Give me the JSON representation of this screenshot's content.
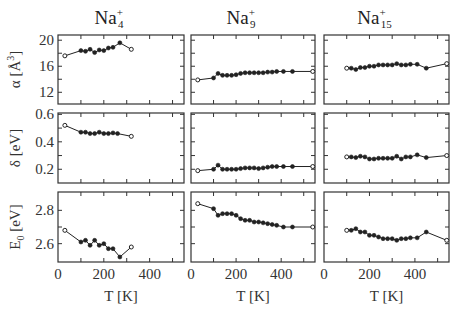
{
  "chart_data": {
    "type": "line",
    "layout": "3x3 grid of panels (rows: alpha, delta, E0; columns: Na4+, Na9+, Na15+)",
    "columns": [
      {
        "title_base": "Na",
        "title_sup": "+",
        "title_sub": "4"
      },
      {
        "title_base": "Na",
        "title_sup": "+",
        "title_sub": "9"
      },
      {
        "title_base": "Na",
        "title_sup": "+",
        "title_sub": "15"
      }
    ],
    "rows": [
      {
        "ylabel": "α [Å³]",
        "ylabel_parts": [
          "α [Å",
          "3",
          "]"
        ],
        "ylim": [
          10.2,
          20.8
        ],
        "yticks": [
          12,
          16,
          20
        ],
        "yminor": [
          14,
          18
        ]
      },
      {
        "ylabel": "δ [eV]",
        "ylim": [
          0.1,
          0.61
        ],
        "yticks": [
          0.2,
          0.4,
          0.6
        ],
        "yminor": [
          0.3,
          0.5
        ]
      },
      {
        "ylabel": "E₀ [eV]",
        "ylabel_parts": [
          "E",
          "0",
          " [eV]"
        ],
        "ylim": [
          2.49,
          2.91
        ],
        "yticks": [
          2.6,
          2.8
        ],
        "yminor": [
          2.7
        ]
      }
    ],
    "xlabel": "T [K]",
    "xlim": [
      0,
      550
    ],
    "xticks": [
      0,
      200,
      400
    ],
    "xminor": [
      100,
      300,
      500
    ],
    "grid": false,
    "legend": null,
    "series": {
      "alpha_Na4": {
        "x": [
          30,
          100,
          120,
          140,
          160,
          180,
          200,
          220,
          240,
          270,
          320
        ],
        "y": [
          17.6,
          18.4,
          18.3,
          18.6,
          18.1,
          18.5,
          18.4,
          18.8,
          18.9,
          19.6,
          18.6
        ]
      },
      "alpha_Na9": {
        "x": [
          30,
          100,
          120,
          140,
          160,
          180,
          200,
          220,
          240,
          260,
          280,
          300,
          320,
          340,
          360,
          380,
          410,
          450,
          540
        ],
        "y": [
          13.9,
          14.2,
          14.9,
          14.6,
          14.6,
          14.6,
          14.7,
          14.9,
          15.0,
          15.0,
          15.0,
          15.0,
          15.0,
          15.1,
          15.1,
          15.2,
          15.2,
          15.2,
          15.2
        ]
      },
      "alpha_Na15": {
        "x": [
          100,
          120,
          140,
          160,
          180,
          200,
          220,
          240,
          260,
          280,
          300,
          320,
          340,
          360,
          380,
          410,
          450,
          540
        ],
        "y": [
          15.7,
          15.7,
          15.5,
          15.8,
          15.8,
          16.0,
          16.0,
          16.2,
          16.2,
          16.2,
          16.2,
          16.4,
          16.2,
          16.2,
          16.3,
          16.3,
          15.7,
          16.4
        ]
      },
      "delta_Na4": {
        "x": [
          30,
          100,
          120,
          140,
          160,
          180,
          200,
          220,
          240,
          260,
          320
        ],
        "y": [
          0.52,
          0.47,
          0.47,
          0.46,
          0.46,
          0.47,
          0.46,
          0.46,
          0.465,
          0.46,
          0.44
        ]
      },
      "delta_Na9": {
        "x": [
          30,
          100,
          120,
          140,
          160,
          180,
          200,
          220,
          240,
          260,
          280,
          300,
          320,
          340,
          360,
          380,
          410,
          450,
          540
        ],
        "y": [
          0.19,
          0.2,
          0.23,
          0.2,
          0.2,
          0.2,
          0.2,
          0.205,
          0.21,
          0.21,
          0.21,
          0.205,
          0.21,
          0.215,
          0.22,
          0.22,
          0.22,
          0.22,
          0.22
        ]
      },
      "delta_Na15": {
        "x": [
          100,
          120,
          140,
          160,
          180,
          200,
          220,
          240,
          260,
          280,
          300,
          320,
          340,
          360,
          380,
          410,
          450,
          540
        ],
        "y": [
          0.29,
          0.29,
          0.285,
          0.295,
          0.29,
          0.275,
          0.275,
          0.28,
          0.28,
          0.28,
          0.28,
          0.295,
          0.275,
          0.29,
          0.29,
          0.305,
          0.285,
          0.3
        ]
      },
      "E0_Na4": {
        "x": [
          30,
          100,
          120,
          140,
          160,
          180,
          200,
          220,
          240,
          270,
          320
        ],
        "y": [
          2.68,
          2.61,
          2.62,
          2.59,
          2.62,
          2.59,
          2.6,
          2.57,
          2.57,
          2.52,
          2.58
        ]
      },
      "E0_Na9": {
        "x": [
          30,
          100,
          120,
          140,
          160,
          180,
          200,
          220,
          240,
          260,
          280,
          300,
          320,
          340,
          360,
          380,
          410,
          450,
          540
        ],
        "y": [
          2.84,
          2.81,
          2.77,
          2.78,
          2.78,
          2.78,
          2.77,
          2.75,
          2.74,
          2.74,
          2.73,
          2.73,
          2.725,
          2.72,
          2.715,
          2.71,
          2.7,
          2.7,
          2.7
        ]
      },
      "E0_Na15": {
        "x": [
          100,
          120,
          140,
          160,
          180,
          200,
          220,
          240,
          260,
          280,
          300,
          320,
          340,
          360,
          380,
          410,
          450,
          540
        ],
        "y": [
          2.68,
          2.68,
          2.69,
          2.67,
          2.67,
          2.65,
          2.65,
          2.64,
          2.63,
          2.63,
          2.63,
          2.62,
          2.63,
          2.63,
          2.635,
          2.635,
          2.67,
          2.62
        ]
      }
    },
    "open_markers": "first and last points of each series drawn as open circles; interior points filled"
  },
  "geometry": {
    "col_left": [
      58,
      191,
      324
    ],
    "col_right": [
      184,
      315,
      449
    ],
    "row_top": [
      35,
      113,
      192
    ],
    "row_bottom": [
      104,
      183,
      262
    ]
  }
}
